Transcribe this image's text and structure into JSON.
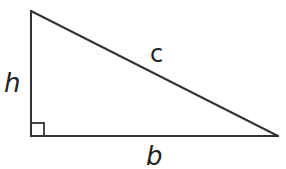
{
  "diagram": {
    "type": "right-triangle",
    "stroke_color": "#333333",
    "background": "#ffffff",
    "vertices": {
      "top": [
        31,
        11
      ],
      "bottom_left": [
        31,
        136
      ],
      "bottom_right": [
        278,
        136
      ]
    },
    "right_angle_marker": {
      "corner": "bottom_left",
      "size": 13
    },
    "labels": {
      "height": "h",
      "hypotenuse": "c",
      "base": "b"
    }
  }
}
